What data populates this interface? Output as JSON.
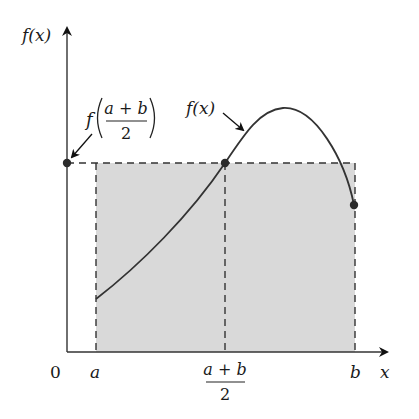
{
  "diagram": {
    "y_axis_label": "f(x)",
    "x_axis_label": "x",
    "origin_label": "0",
    "tick_a_label": "a",
    "tick_b_label": "b",
    "midpoint_numerator": "a + b",
    "midpoint_denominator": "2",
    "curve_label": "f(x)",
    "value_label_prefix": "f",
    "value_label_numerator": "a + b",
    "value_label_denominator": "2",
    "colors": {
      "shade": "#d9d9d9",
      "line": "#333333",
      "dashes": "#333333",
      "points": "#2b2b2b"
    }
  }
}
